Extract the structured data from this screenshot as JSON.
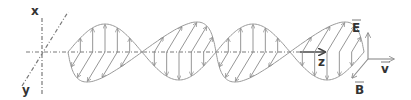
{
  "figure": {
    "axes": {
      "x_label": "x",
      "y_label": "y",
      "z_label": "z"
    },
    "triad": {
      "e_label": "E",
      "b_label": "B",
      "v_label": "v"
    },
    "wave": {
      "half_cycles": 4,
      "arrows_per_half_cycle": 5
    },
    "colors": {
      "line": "#8a8a8a",
      "axis": "#555555",
      "text": "#333333"
    }
  }
}
